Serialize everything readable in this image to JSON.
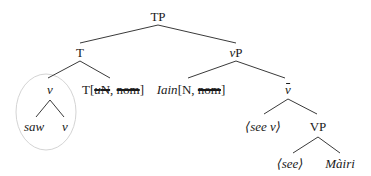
{
  "diagram": {
    "type": "syntax-tree",
    "nodes": {
      "tp": "TP",
      "t_bar": "T",
      "vp_small": "vP",
      "v_head": "v",
      "saw": "saw",
      "v_leaf": "v",
      "t_head": "T",
      "t_features_open": "[",
      "t_feature_uN_u": "u",
      "t_feature_uN_N": "N",
      "t_features_sep": ", ",
      "t_feature_nom": "nom",
      "t_features_close": "]",
      "iain_name": "Iain",
      "iain_features_open": "[N, ",
      "iain_feature_nom": "nom",
      "iain_features_close": "]",
      "v_bar": "v",
      "see_v_copy": "⟨see v⟩",
      "vp": "VP",
      "see_copy": "⟨see⟩",
      "mairi": "Màiri"
    },
    "edges": [
      [
        "TP",
        "T"
      ],
      [
        "TP",
        "vP"
      ],
      [
        "T",
        "v"
      ],
      [
        "T",
        "T[uN, nom]"
      ],
      [
        "v",
        "saw"
      ],
      [
        "v",
        "v"
      ],
      [
        "vP",
        "Iain[N, nom]"
      ],
      [
        "vP",
        "v̄"
      ],
      [
        "v̄",
        "⟨see v⟩"
      ],
      [
        "v̄",
        "VP"
      ],
      [
        "VP",
        "⟨see⟩"
      ],
      [
        "VP",
        "Màiri"
      ]
    ],
    "struck_features": [
      "uN (on T)",
      "nom (on T)",
      "nom (on Iain)"
    ],
    "highlight": "light gray circle around the v complex (saw + v)",
    "colors": {
      "lines": "#3a3a3a",
      "text": "#1a1a1a",
      "circle": "#d0d0d0"
    }
  }
}
